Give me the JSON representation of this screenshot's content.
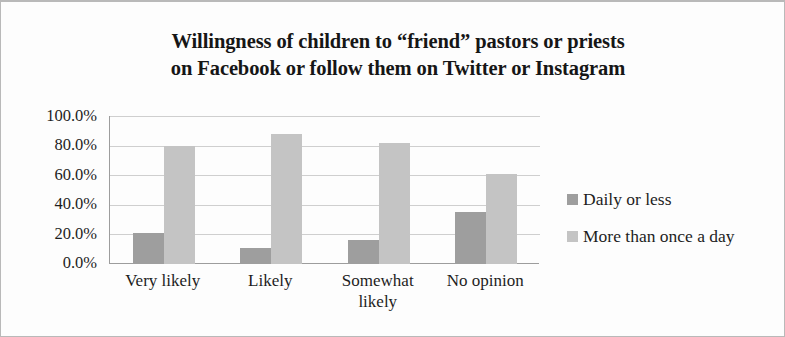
{
  "chart_data": {
    "type": "bar",
    "title": "Willingness of children to “friend” pastors or priests on Facebook or follow them on Twitter or Instagram",
    "title_lines": [
      "Willingness of children to “friend” pastors or priests",
      "on Facebook or follow them on Twitter or Instagram"
    ],
    "xlabel": "",
    "ylabel": "",
    "categories": [
      "Very likely",
      "Likely",
      "Somewhat likely",
      "No opinion"
    ],
    "category_lines": [
      [
        "Very likely"
      ],
      [
        "Likely"
      ],
      [
        "Somewhat",
        "likely"
      ],
      [
        "No opinion"
      ]
    ],
    "series": [
      {
        "name": "Daily or less",
        "color": "#9e9e9e",
        "values": [
          21,
          11,
          16,
          35
        ],
        "value_labels": [
          "21.0%",
          "11.0%",
          "16.0%",
          "35.0%"
        ]
      },
      {
        "name": "More than once a day",
        "color": "#c4c4c4",
        "values": [
          80,
          88,
          82,
          61
        ],
        "value_labels": [
          "80.0%",
          "88.0%",
          "82.0%",
          "61.0%"
        ]
      }
    ],
    "ylim": [
      0,
      100
    ],
    "ytick_values": [
      100,
      80,
      60,
      40,
      20,
      0
    ],
    "ytick_labels": [
      "100.0%",
      "80.0%",
      "60.0%",
      "40.0%",
      "20.0%",
      "0.0%"
    ],
    "grid": true,
    "grid_axis": "y",
    "legend_position": "right"
  }
}
